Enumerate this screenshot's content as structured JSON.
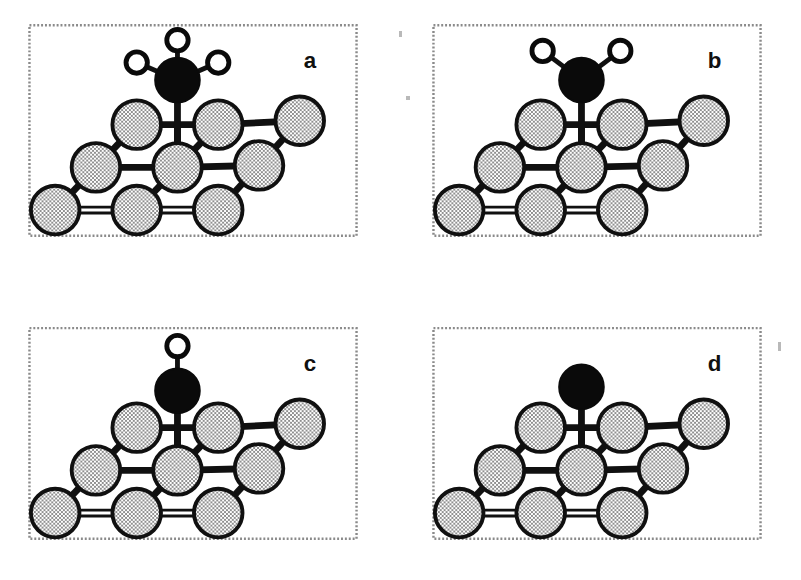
{
  "figure": {
    "title": "",
    "background_color": "#ffffff",
    "width": 801,
    "height": 580,
    "layout": "2x2 grid of panels"
  },
  "legend_semantics": {
    "surface_atom": {
      "name": "metal surface atom",
      "fill": "#d4d4d4",
      "stroke": "#101010",
      "texture": "dithered checkerboard gray"
    },
    "carbon_atom": {
      "name": "carbon atom",
      "fill": "#0a0a0a",
      "stroke": "#0a0a0a",
      "texture": "solid black"
    },
    "hydrogen_atom": {
      "name": "hydrogen atom",
      "fill": "#ffffff",
      "stroke": "#0a0a0a",
      "texture": "open white circle"
    }
  },
  "geometry": {
    "surface_atom_radius": 25,
    "carbon_radius": 23,
    "hydrogen_radius": 11,
    "bond_width": 7,
    "thin_bond_width": 4,
    "border_color": "#8a8a8a",
    "border_dash": "2 2"
  },
  "lattice": {
    "comment": "Local coordinates inside each panel SVG (viewBox 0 0 340 240). Three rows, upper terrace stepped up to the right.",
    "row_top": [
      {
        "cx": 112,
        "cy": 104
      },
      {
        "cx": 196,
        "cy": 104
      },
      {
        "cx": 280,
        "cy": 100
      }
    ],
    "row_middle": [
      {
        "cx": 70,
        "cy": 148
      },
      {
        "cx": 154,
        "cy": 148
      },
      {
        "cx": 238,
        "cy": 146
      }
    ],
    "row_bottom": [
      {
        "cx": 28,
        "cy": 192
      },
      {
        "cx": 112,
        "cy": 192
      },
      {
        "cx": 196,
        "cy": 192
      }
    ],
    "adsorption_site": {
      "cx": 154,
      "cy": 148
    }
  },
  "panels": [
    {
      "id": "a",
      "label": "a",
      "label_x": 284,
      "label_y": 46,
      "species": "CH3",
      "species_name": "methyl",
      "hydrogen_count": 3,
      "frame": {
        "left": 28,
        "top": 20,
        "width": 330,
        "height": 212
      },
      "carbon": {
        "cx": 154,
        "cy": 58
      },
      "hydrogens": [
        {
          "cx": 112,
          "cy": 40,
          "angle_deg": -157,
          "label": "H-left"
        },
        {
          "cx": 154,
          "cy": 17,
          "angle_deg": -90,
          "label": "H-top"
        },
        {
          "cx": 196,
          "cy": 40,
          "angle_deg": -23,
          "label": "H-right"
        }
      ]
    },
    {
      "id": "b",
      "label": "b",
      "label_x": 284,
      "label_y": 46,
      "species": "CH2",
      "species_name": "methylene",
      "hydrogen_count": 2,
      "frame": {
        "left": 432,
        "top": 20,
        "width": 330,
        "height": 212
      },
      "carbon": {
        "cx": 154,
        "cy": 58
      },
      "hydrogens": [
        {
          "cx": 114,
          "cy": 28,
          "angle_deg": -143,
          "label": "H-left"
        },
        {
          "cx": 194,
          "cy": 28,
          "angle_deg": -37,
          "label": "H-right"
        }
      ]
    },
    {
      "id": "c",
      "label": "c",
      "label_x": 284,
      "label_y": 46,
      "species": "CH",
      "species_name": "methylidyne",
      "hydrogen_count": 1,
      "frame": {
        "left": 28,
        "top": 323,
        "width": 330,
        "height": 212
      },
      "carbon": {
        "cx": 154,
        "cy": 66
      },
      "hydrogens": [
        {
          "cx": 154,
          "cy": 20,
          "angle_deg": -90,
          "label": "H-top"
        }
      ]
    },
    {
      "id": "d",
      "label": "d",
      "label_x": 284,
      "label_y": 46,
      "species": "C",
      "species_name": "atomic carbon",
      "hydrogen_count": 0,
      "frame": {
        "left": 432,
        "top": 323,
        "width": 330,
        "height": 212
      },
      "carbon": {
        "cx": 154,
        "cy": 62
      },
      "hydrogens": []
    }
  ],
  "artifacts": [
    {
      "name": "scan-speck-top",
      "x": 399,
      "y": 31,
      "w": 3,
      "h": 6
    },
    {
      "name": "scan-speck-left",
      "x": 406,
      "y": 96,
      "w": 4,
      "h": 4
    },
    {
      "name": "scan-speck-right",
      "x": 778,
      "y": 342,
      "w": 3,
      "h": 9
    }
  ]
}
